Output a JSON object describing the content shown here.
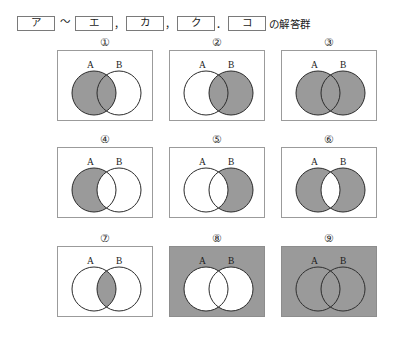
{
  "header": {
    "tokens": [
      "ア",
      "エ",
      "カ",
      "ク",
      "コ"
    ],
    "separators": {
      "tilde": "～",
      "comma": "，",
      "period": "．"
    },
    "tail_text": "の解答群"
  },
  "colors": {
    "shade_gray": "#9a9a9a",
    "frame_border": "#9b9b9b",
    "circle_stroke": "#2b2b2b",
    "text": "#1a1a1a",
    "page_background": "#ffffff"
  },
  "diagram_legend": {
    "set_a_label": "A",
    "set_b_label": "B"
  },
  "options": [
    {
      "number": "①",
      "label": "1",
      "description": "set-a-including-intersection-shaded",
      "universe_shaded": false,
      "regions": {
        "a_only": true,
        "intersection": true,
        "b_only": false,
        "outside": false
      }
    },
    {
      "number": "②",
      "label": "2",
      "description": "set-b-including-intersection-shaded",
      "universe_shaded": false,
      "regions": {
        "a_only": false,
        "intersection": true,
        "b_only": true,
        "outside": false
      }
    },
    {
      "number": "③",
      "label": "3",
      "description": "union-a-or-b-shaded",
      "universe_shaded": false,
      "regions": {
        "a_only": true,
        "intersection": true,
        "b_only": true,
        "outside": false
      }
    },
    {
      "number": "④",
      "label": "4",
      "description": "a-minus-b-shaded",
      "universe_shaded": false,
      "regions": {
        "a_only": true,
        "intersection": false,
        "b_only": false,
        "outside": false
      }
    },
    {
      "number": "⑤",
      "label": "5",
      "description": "b-minus-a-shaded",
      "universe_shaded": false,
      "regions": {
        "a_only": false,
        "intersection": false,
        "b_only": true,
        "outside": false
      }
    },
    {
      "number": "⑥",
      "label": "6",
      "description": "symmetric-difference-shaded",
      "universe_shaded": false,
      "regions": {
        "a_only": true,
        "intersection": false,
        "b_only": true,
        "outside": false
      }
    },
    {
      "number": "⑦",
      "label": "7",
      "description": "intersection-only-shaded",
      "universe_shaded": false,
      "regions": {
        "a_only": false,
        "intersection": true,
        "b_only": false,
        "outside": false
      }
    },
    {
      "number": "⑧",
      "label": "8",
      "description": "complement-of-union-shaded",
      "universe_shaded": true,
      "regions": {
        "a_only": false,
        "intersection": false,
        "b_only": false,
        "outside": true
      }
    },
    {
      "number": "⑨",
      "label": "9",
      "description": "entire-universe-shaded",
      "universe_shaded": true,
      "regions": {
        "a_only": true,
        "intersection": true,
        "b_only": true,
        "outside": true
      }
    }
  ]
}
